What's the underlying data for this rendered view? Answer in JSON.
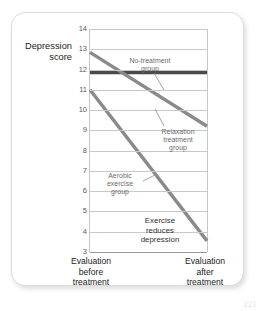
{
  "figure": {
    "page_number": "221"
  },
  "chart_data": {
    "type": "line",
    "title": "",
    "ylabel": "Depression\nscore",
    "xlabel": "",
    "ylim": [
      3,
      14
    ],
    "yticks": [
      14,
      13,
      12,
      11,
      10,
      9,
      8,
      7,
      6,
      5,
      4,
      3
    ],
    "grid": true,
    "legend": "inline-annotations",
    "x": [
      "Evaluation before treatment",
      "Evaluation after treatment"
    ],
    "categories": [
      "Evaluation\nbefore\ntreatment",
      "Evaluation\nafter\ntreatment"
    ],
    "series": [
      {
        "name": "No-treatment group",
        "values": [
          11.85,
          11.85
        ],
        "color": "#4a4a4a",
        "width": 3.4
      },
      {
        "name": "Relaxation treatment group",
        "values": [
          12.85,
          9.2
        ],
        "color": "#8a8a8a",
        "width": 3.4
      },
      {
        "name": "Aerobic exercise group",
        "values": [
          11.0,
          3.55
        ],
        "color": "#8a8a8a",
        "width": 3.4
      }
    ],
    "annotations": [
      {
        "id": "no-treatment",
        "text": "No-treatment\ngroup"
      },
      {
        "id": "relaxation",
        "text": "Relaxation\ntreatment\ngroup"
      },
      {
        "id": "aerobic",
        "text": "Aerobic\nexercise\ngroup"
      },
      {
        "id": "conclusion",
        "text": "Exercise\nreduces\ndepression"
      }
    ]
  }
}
